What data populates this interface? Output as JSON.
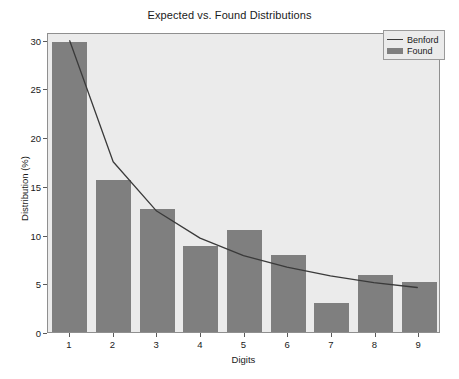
{
  "chart_data": {
    "type": "bar",
    "title": "Expected vs. Found Distributions",
    "xlabel": "Digits",
    "ylabel": "Distribution (%)",
    "categories": [
      "1",
      "2",
      "3",
      "4",
      "5",
      "6",
      "7",
      "8",
      "9"
    ],
    "xticklabels": [
      "1",
      "2",
      "3",
      "4",
      "5",
      "6",
      "7",
      "8",
      "9"
    ],
    "yticklabels": [
      "0",
      "5",
      "10",
      "15",
      "20",
      "25",
      "30"
    ],
    "yticks": [
      0,
      5,
      10,
      15,
      20,
      25,
      30
    ],
    "ylim": [
      0,
      30.8
    ],
    "xlim": [
      0.5,
      9.5
    ],
    "grid": false,
    "legend_position": "upper right",
    "series": [
      {
        "name": "Benford",
        "type": "line",
        "color": "#3a3a3a",
        "values": [
          30.1,
          17.6,
          12.5,
          9.7,
          7.9,
          6.7,
          5.8,
          5.1,
          4.6
        ]
      },
      {
        "name": "Found",
        "type": "bar",
        "color": "#7f7f7f",
        "values": [
          29.8,
          15.6,
          12.6,
          8.8,
          10.5,
          7.9,
          3.0,
          5.9,
          5.1
        ]
      }
    ]
  },
  "figure": {
    "background_color": "#ffffff",
    "axes_background_color": "#ebebeb",
    "axes_edge_color": "#8f8f8f"
  },
  "legend": {
    "entries": [
      {
        "label": "Benford",
        "marker": "line"
      },
      {
        "label": "Found",
        "marker": "bar"
      }
    ]
  }
}
